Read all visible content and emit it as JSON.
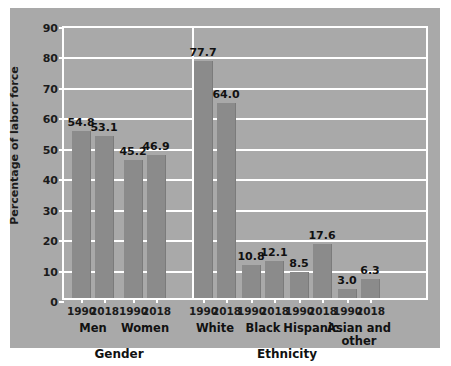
{
  "chart_data": {
    "type": "bar",
    "title": "",
    "xlabel": "",
    "ylabel": "Percentage of labor force",
    "ylim": [
      0,
      90
    ],
    "yticks": [
      0,
      10,
      20,
      30,
      40,
      50,
      60,
      70,
      80,
      90
    ],
    "grid": true,
    "legend": "none",
    "categories": [
      "Men",
      "Women",
      "White",
      "Black",
      "Hispanic",
      "Asian and other"
    ],
    "series": [
      {
        "name": "1990",
        "values": [
          54.8,
          45.2,
          77.7,
          10.8,
          8.5,
          3.0
        ]
      },
      {
        "name": "2018",
        "values": [
          53.1,
          46.9,
          64.0,
          12.1,
          17.6,
          6.3
        ]
      }
    ],
    "sections": [
      {
        "label": "Gender",
        "groups": [
          {
            "label": "Men",
            "label_lines": [
              "Men"
            ],
            "bars": [
              {
                "year": "1990",
                "value": 54.8,
                "value_label": "54.8"
              },
              {
                "year": "2018",
                "value": 53.1,
                "value_label": "53.1"
              }
            ]
          },
          {
            "label": "Women",
            "label_lines": [
              "Women"
            ],
            "bars": [
              {
                "year": "1990",
                "value": 45.2,
                "value_label": "45.2"
              },
              {
                "year": "2018",
                "value": 46.9,
                "value_label": "46.9"
              }
            ]
          }
        ]
      },
      {
        "label": "Ethnicity",
        "groups": [
          {
            "label": "White",
            "label_lines": [
              "White"
            ],
            "bars": [
              {
                "year": "1990",
                "value": 77.7,
                "value_label": "77.7"
              },
              {
                "year": "2018",
                "value": 64.0,
                "value_label": "64.0"
              }
            ]
          },
          {
            "label": "Black",
            "label_lines": [
              "Black"
            ],
            "bars": [
              {
                "year": "1990",
                "value": 10.8,
                "value_label": "10.8"
              },
              {
                "year": "2018",
                "value": 12.1,
                "value_label": "12.1"
              }
            ]
          },
          {
            "label": "Hispanic",
            "label_lines": [
              "Hispanic"
            ],
            "bars": [
              {
                "year": "1990",
                "value": 8.5,
                "value_label": "8.5"
              },
              {
                "year": "2018",
                "value": 17.6,
                "value_label": "17.6"
              }
            ]
          },
          {
            "label": "Asian and other",
            "label_lines": [
              "Asian and",
              "other"
            ],
            "bars": [
              {
                "year": "1990",
                "value": 3.0,
                "value_label": "3.0"
              },
              {
                "year": "2018",
                "value": 6.3,
                "value_label": "6.3"
              }
            ]
          }
        ]
      }
    ]
  },
  "colors": {
    "panel_background": "#a9a9a9",
    "page_background": "#ffffff",
    "bar_fill": "#8b8b8b",
    "gridline": "#ffffff",
    "text": "#111111"
  }
}
